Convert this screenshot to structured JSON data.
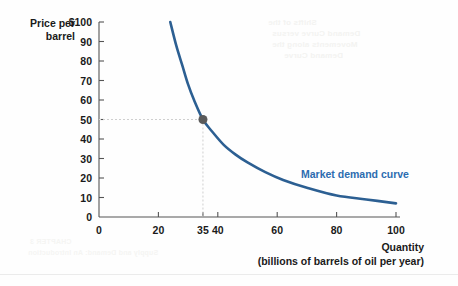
{
  "chart_data": {
    "type": "line",
    "title": "",
    "subtitle": "",
    "ylabel_line1": "Price per",
    "ylabel_line2": "barrel",
    "xlabel_line1": "Quantity",
    "xlabel_line2": "(billions of barrels of oil per year)",
    "xlim": [
      0,
      100
    ],
    "ylim": [
      0,
      100
    ],
    "grid": false,
    "legend_position": "inline-annotation",
    "y_ticks": [
      {
        "value": 100,
        "label": "$100"
      },
      {
        "value": 90,
        "label": "90"
      },
      {
        "value": 80,
        "label": "80"
      },
      {
        "value": 70,
        "label": "70"
      },
      {
        "value": 60,
        "label": "60"
      },
      {
        "value": 50,
        "label": "50"
      },
      {
        "value": 40,
        "label": "40"
      },
      {
        "value": 30,
        "label": "30"
      },
      {
        "value": 20,
        "label": "20"
      },
      {
        "value": 10,
        "label": "10"
      },
      {
        "value": 0,
        "label": "0"
      }
    ],
    "x_ticks": [
      {
        "value": 0,
        "label": "0"
      },
      {
        "value": 20,
        "label": "20"
      },
      {
        "value": 35,
        "label": "35"
      },
      {
        "value": 40,
        "label": "40"
      },
      {
        "value": 60,
        "label": "60"
      },
      {
        "value": 80,
        "label": "80"
      },
      {
        "value": 100,
        "label": "100"
      }
    ],
    "series": [
      {
        "name": "Market demand curve",
        "color": "#2c5f92",
        "label": "Market demand curve",
        "label_x": 68,
        "label_y": 22,
        "points": [
          {
            "x": 24,
            "y": 100
          },
          {
            "x": 26,
            "y": 88
          },
          {
            "x": 28,
            "y": 78
          },
          {
            "x": 30,
            "y": 68
          },
          {
            "x": 32,
            "y": 60
          },
          {
            "x": 35,
            "y": 50
          },
          {
            "x": 38,
            "y": 44
          },
          {
            "x": 42,
            "y": 37
          },
          {
            "x": 46,
            "y": 32
          },
          {
            "x": 50,
            "y": 28
          },
          {
            "x": 56,
            "y": 23
          },
          {
            "x": 62,
            "y": 19
          },
          {
            "x": 70,
            "y": 15
          },
          {
            "x": 80,
            "y": 11
          },
          {
            "x": 90,
            "y": 9
          },
          {
            "x": 100,
            "y": 7
          }
        ]
      }
    ],
    "markers": [
      {
        "name": "equilibrium-point",
        "x": 35,
        "y": 50,
        "color": "#5a5a5a",
        "radius": 4.5,
        "guide_color": "#cfcfcf"
      }
    ],
    "colors": {
      "curve": "#2c5f92",
      "curve_label": "#2c6cb0",
      "axis": "#555555",
      "text": "#1a1a1a",
      "guide": "#cfcfcf",
      "background": "#fefefe"
    }
  },
  "bleed_text": {
    "line1": "Shifts of the",
    "line2": "Demand Curve versus",
    "line3": "Movements along the",
    "line4": "Demand Curve",
    "line5": "CHAPTER 3",
    "line6": "Supply and Demand: An Introduction"
  }
}
